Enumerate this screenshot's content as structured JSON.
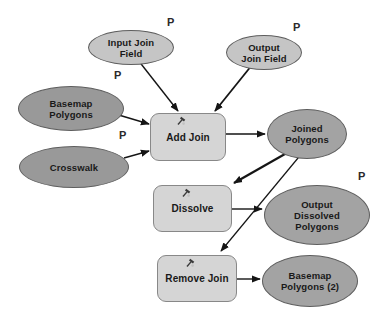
{
  "diagram": {
    "type": "modelbuilder-flow",
    "background": "#ffffff",
    "colors": {
      "input_parameter_fill": "#c5c5c5",
      "source_data_fill": "#999999",
      "derived_data_fill": "#a3a3a3",
      "tool_fill": "#d5d5d5",
      "ellipse_border": "#5e5e5e",
      "tool_border": "#888888",
      "connector": "#151515",
      "text": "#191919"
    },
    "nodes": [
      {
        "id": "input-join-field",
        "kind": "variable-ellipse",
        "label": "Input Join\nField",
        "parameter": "P"
      },
      {
        "id": "output-join-field",
        "kind": "variable-ellipse",
        "label": "Output\nJoin Field",
        "parameter": "P"
      },
      {
        "id": "basemap-polygons",
        "kind": "data-ellipse",
        "label": "Basemap\nPolygons",
        "parameter": "P"
      },
      {
        "id": "crosswalk",
        "kind": "data-ellipse",
        "label": "Crosswalk",
        "parameter": "P"
      },
      {
        "id": "add-join",
        "kind": "tool-rect",
        "label": "Add Join"
      },
      {
        "id": "joined-polygons",
        "kind": "derived-ellipse",
        "label": "Joined\nPolygons"
      },
      {
        "id": "dissolve",
        "kind": "tool-rect",
        "label": "Dissolve"
      },
      {
        "id": "output-dissolved-polygons",
        "kind": "derived-ellipse",
        "label": "Output\nDissolved\nPolygons",
        "parameter": "P"
      },
      {
        "id": "remove-join",
        "kind": "tool-rect",
        "label": "Remove Join"
      },
      {
        "id": "basemap-polygons-2",
        "kind": "derived-ellipse",
        "label": "Basemap\nPolygons (2)"
      }
    ],
    "parameter_marks": [
      {
        "text": "P",
        "for": "input-join-field"
      },
      {
        "text": "P",
        "for": "output-join-field"
      },
      {
        "text": "P",
        "for": "basemap-polygons"
      },
      {
        "text": "P",
        "for": "crosswalk"
      },
      {
        "text": "P",
        "for": "output-dissolved-polygons"
      }
    ],
    "connectors": [
      {
        "from": "input-join-field",
        "to": "add-join"
      },
      {
        "from": "output-join-field",
        "to": "add-join"
      },
      {
        "from": "basemap-polygons",
        "to": "add-join"
      },
      {
        "from": "crosswalk",
        "to": "add-join"
      },
      {
        "from": "add-join",
        "to": "joined-polygons"
      },
      {
        "from": "joined-polygons",
        "to": "dissolve"
      },
      {
        "from": "dissolve",
        "to": "output-dissolved-polygons"
      },
      {
        "from": "joined-polygons",
        "to": "remove-join"
      },
      {
        "from": "remove-join",
        "to": "basemap-polygons-2"
      }
    ]
  }
}
